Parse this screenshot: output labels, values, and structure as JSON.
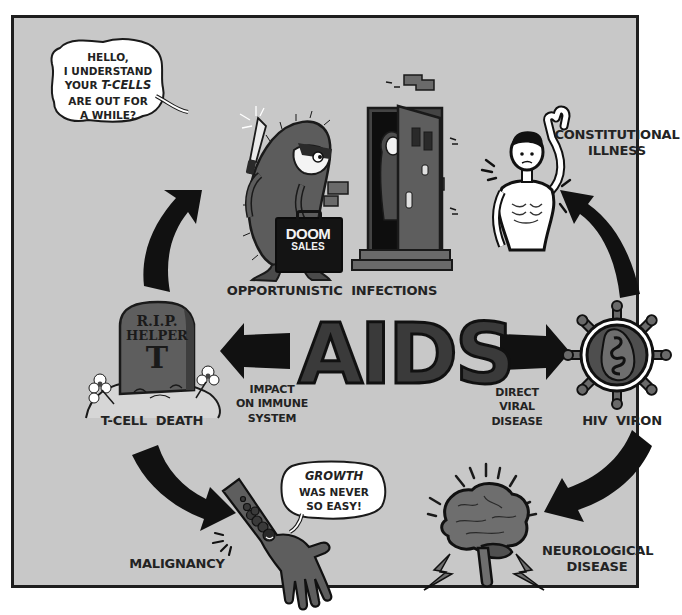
{
  "title": "AIDS",
  "colors": {
    "background": "#c8c8c8",
    "frame_border": "#1e1e1e",
    "text": "#232323",
    "arrow": "#111111",
    "illustration_fill": "#5a5a5a"
  },
  "center": {
    "title": "AIDS"
  },
  "nodes": {
    "opportunistic_infections": {
      "label": "OPPORTUNISTIC  INFECTIONS",
      "speech_bubble": {
        "line1": "HELLO,",
        "line2": "I UNDERSTAND",
        "line3_prefix": "YOUR ",
        "line3_emphasis": "T-CELLS",
        "line4": "ARE OUT FOR",
        "line5": "A WHILE?"
      },
      "briefcase_line1": "DOOM",
      "briefcase_line2": "SALES"
    },
    "constitutional_illness": {
      "label_line1": "CONSTITUTIONAL",
      "label_line2": "ILLNESS"
    },
    "hiv_viron": {
      "label": "HIV  VIRON"
    },
    "neurological_disease": {
      "label_line1": "NEUROLOGICAL",
      "label_line2": "DISEASE"
    },
    "malignancy": {
      "label": "MALIGNANCY",
      "speech_bubble": {
        "line1": "GROWTH",
        "line2": "WAS NEVER",
        "line3": "SO EASY!"
      }
    },
    "t_cell_death": {
      "label": "T-CELL  DEATH",
      "tombstone_line1": "R.I.P.",
      "tombstone_line2": "HELPER",
      "tombstone_line3": "T"
    }
  },
  "edges": {
    "left": {
      "line1": "IMPACT",
      "line2": "ON IMMUNE",
      "line3": "SYSTEM"
    },
    "right": {
      "line1": "DIRECT",
      "line2": "VIRAL",
      "line3": "DISEASE"
    }
  },
  "icons": [
    "virus-salesman-icon",
    "knife-icon",
    "briefcase-icon",
    "door-icon",
    "woman-at-door-icon",
    "emaciated-man-icon",
    "hiv-virion-icon",
    "brain-icon",
    "lightning-icon",
    "hand-tumor-icon",
    "tombstone-icon",
    "flower-icon",
    "curved-arrow-icon",
    "straight-arrow-icon"
  ]
}
